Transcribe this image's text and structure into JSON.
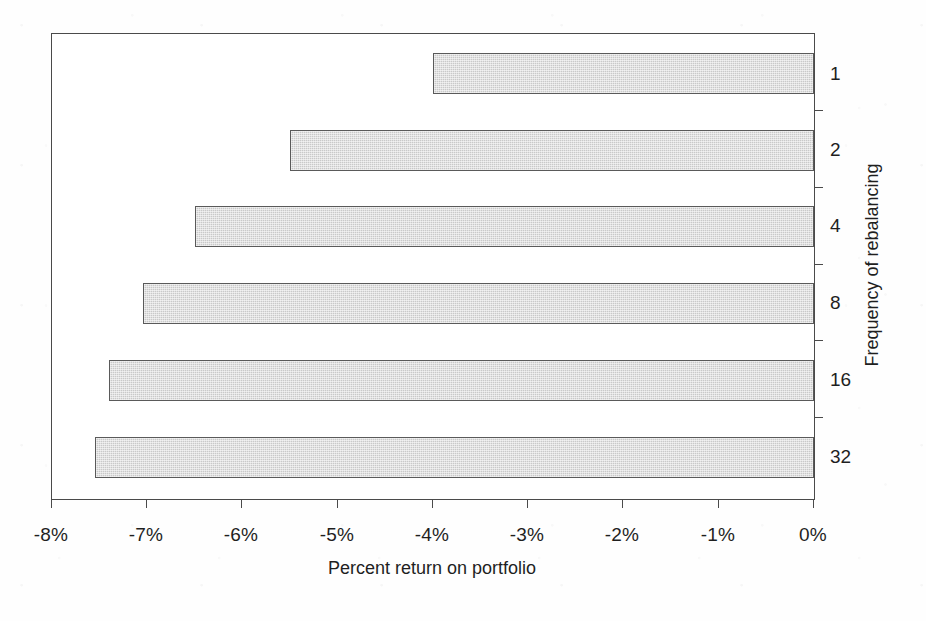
{
  "chart_data": {
    "type": "bar",
    "orientation": "horizontal",
    "title": "",
    "subtitle": "",
    "xlabel": "Percent return on portfolio",
    "ylabel": "Frequency of rebalancing",
    "categories": [
      "1",
      "2",
      "4",
      "8",
      "16",
      "32"
    ],
    "values": [
      -4.0,
      -5.5,
      -6.5,
      -7.05,
      -7.4,
      -7.55
    ],
    "series": [
      {
        "name": "Percent return on portfolio",
        "values": [
          -4.0,
          -5.5,
          -6.5,
          -7.05,
          -7.4,
          -7.55
        ]
      }
    ],
    "xlim": [
      -8,
      0
    ],
    "ylim": null,
    "xticks": [
      -8,
      -7,
      -6,
      -5,
      -4,
      -3,
      -2,
      -1,
      0
    ],
    "xticklabels": [
      "-8%",
      "-7%",
      "-6%",
      "-5%",
      "-4%",
      "-3%",
      "-2%",
      "-1%",
      "0%"
    ],
    "yticklabels": [
      "1",
      "2",
      "4",
      "8",
      "16",
      "32"
    ],
    "grid": false,
    "legend": false,
    "legend_position": "none",
    "annotations": [],
    "colors": {
      "bar_fill": "#c9c9c9",
      "bar_edge": "#5a5a5a",
      "axis": "#4a4a4a",
      "text": "#1f1f1f",
      "background": "#ffffff"
    },
    "axis_positions": {
      "y_axis_labels_side": "right",
      "y_axis_title_side": "right"
    }
  }
}
